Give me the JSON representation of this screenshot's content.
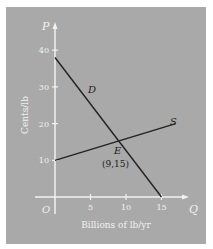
{
  "chart_data": {
    "type": "line",
    "title": "",
    "xlabel": "Billions of lb/yr",
    "ylabel": "Cents/lb",
    "x_axis_letter": "Q",
    "y_axis_letter": "P",
    "origin_label": "O",
    "xlim": [
      0,
      18
    ],
    "ylim": [
      0,
      45
    ],
    "x_ticks": [
      5,
      10,
      15
    ],
    "y_ticks": [
      10,
      20,
      30,
      40
    ],
    "grid": false,
    "series": [
      {
        "name": "D",
        "points": [
          [
            0,
            38
          ],
          [
            15,
            0
          ]
        ],
        "color": "#222222"
      },
      {
        "name": "S",
        "points": [
          [
            0,
            10
          ],
          [
            17,
            20
          ]
        ],
        "color": "#222222"
      }
    ],
    "annotations": [
      {
        "label": "E",
        "coords_label": "(9,15)",
        "x": 9,
        "y": 15
      }
    ],
    "colors": {
      "panel": "#a9a9a9",
      "axes": "#f2f2f2",
      "lines": "#222222"
    }
  }
}
